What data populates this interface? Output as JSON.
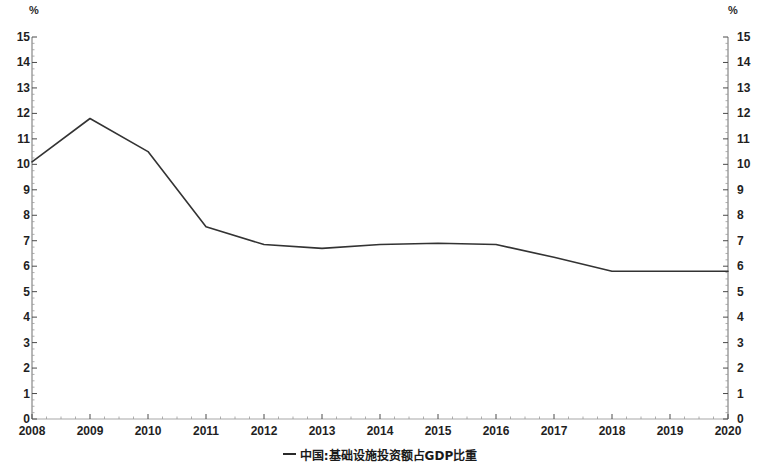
{
  "chart_data": {
    "type": "line",
    "title": "",
    "subtitle": "",
    "xlabel": "",
    "ylabel": "%",
    "ylabel_right": "%",
    "xlim": [
      2008,
      2020
    ],
    "ylim": [
      0,
      15
    ],
    "ytick_step": 1,
    "yminor_step": 0.25,
    "grid": false,
    "legend_position": "bottom-center",
    "categories": [
      "2008",
      "2009",
      "2010",
      "2011",
      "2012",
      "2013",
      "2014",
      "2015",
      "2016",
      "2017",
      "2018",
      "2019",
      "2020"
    ],
    "x": [
      2008,
      2009,
      2010,
      2011,
      2012,
      2013,
      2014,
      2015,
      2016,
      2017,
      2018,
      2019,
      2020
    ],
    "series": [
      {
        "name": "中国:基础设施投资额占GDP比重",
        "values": [
          10.1,
          11.8,
          10.5,
          7.55,
          6.85,
          6.7,
          6.85,
          6.9,
          6.85,
          6.35,
          5.8,
          5.8,
          5.8
        ]
      }
    ],
    "ytick_labels_left": [
      "15",
      "14",
      "13",
      "12",
      "11",
      "10",
      "9",
      "8",
      "7",
      "6",
      "5",
      "4",
      "3",
      "2",
      "1",
      "0"
    ],
    "ytick_labels_right": [
      "15",
      "14",
      "13",
      "12",
      "11",
      "10",
      "9",
      "8",
      "7",
      "6",
      "5",
      "4",
      "3",
      "2",
      "1",
      "0"
    ],
    "ytick_values": [
      15,
      14,
      13,
      12,
      11,
      10,
      9,
      8,
      7,
      6,
      5,
      4,
      3,
      2,
      1,
      0
    ],
    "xtick_labels": [
      "2008",
      "2009",
      "2010",
      "2011",
      "2012",
      "2013",
      "2014",
      "2015",
      "2016",
      "2017",
      "2018",
      "2019",
      "2020"
    ],
    "line_color": "#333333",
    "axis_color": "#6e6e6e",
    "background_color": "#ffffff"
  },
  "legend": {
    "label": "中国:基础设施投资额占GDP比重",
    "marker": "line-marker"
  },
  "axes": {
    "unit_left": "%",
    "unit_right": "%"
  }
}
